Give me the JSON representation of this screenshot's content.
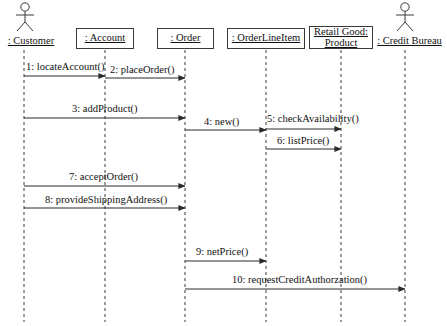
{
  "diagram": {
    "type": "uml-sequence-diagram",
    "width": 447,
    "height": 326,
    "background_color": "#ffffff",
    "line_color": "#3a3a3a",
    "text_color": "#111111",
    "lifeline_style": "dashed"
  },
  "participants": [
    {
      "id": "customer",
      "label": ": Customer",
      "kind": "actor",
      "x": 24,
      "box": {
        "left": 0,
        "top": 35,
        "width": 62,
        "height": 14
      },
      "figure": {
        "left": 14,
        "top": 2,
        "width": 22,
        "height": 30
      }
    },
    {
      "id": "account",
      "label": ": Account",
      "kind": "object",
      "x": 105,
      "box": {
        "left": 76,
        "top": 28,
        "width": 58,
        "height": 21
      }
    },
    {
      "id": "order",
      "label": ": Order",
      "kind": "object",
      "x": 185,
      "box": {
        "left": 157,
        "top": 28,
        "width": 57,
        "height": 21
      }
    },
    {
      "id": "orderlineitem",
      "label": ": OrderLineItem",
      "kind": "object",
      "x": 266,
      "box": {
        "left": 227,
        "top": 28,
        "width": 78,
        "height": 21
      }
    },
    {
      "id": "product",
      "label_line1": "Retail Good:",
      "label_line2": "Product",
      "kind": "object",
      "x": 341,
      "box": {
        "left": 309,
        "top": 26,
        "width": 64,
        "height": 23
      }
    },
    {
      "id": "creditbureau",
      "label": ": Credit Bureau",
      "kind": "actor",
      "x": 405,
      "box": {
        "left": 372,
        "top": 35,
        "width": 75,
        "height": 14
      },
      "figure": {
        "left": 394,
        "top": 2,
        "width": 22,
        "height": 30
      }
    }
  ],
  "lifelines": {
    "top": 50,
    "bottom": 322
  },
  "messages": [
    {
      "seq": 1,
      "label": "1: locateAccount()",
      "from": "customer",
      "to": "account",
      "from_x": 24,
      "to_x": 105,
      "y": 76,
      "label_x": 26,
      "label_y": 61,
      "direction": "right"
    },
    {
      "seq": 2,
      "label": "2: placeOrder()",
      "from": "account",
      "to": "order",
      "from_x": 105,
      "to_x": 185,
      "y": 78,
      "label_x": 110,
      "label_y": 64,
      "direction": "right"
    },
    {
      "seq": 3,
      "label": "3: addProduct()",
      "from": "customer",
      "to": "order",
      "from_x": 24,
      "to_x": 185,
      "y": 118,
      "label_x": 72,
      "label_y": 103,
      "direction": "right"
    },
    {
      "seq": 4,
      "label": "4: new()",
      "from": "order",
      "to": "orderlineitem",
      "from_x": 185,
      "to_x": 266,
      "y": 130,
      "label_x": 204,
      "label_y": 116,
      "direction": "right"
    },
    {
      "seq": 5,
      "label": "5: checkAvailability()",
      "from": "orderlineitem",
      "to": "product",
      "from_x": 266,
      "to_x": 341,
      "y": 129,
      "label_x": 267,
      "label_y": 113,
      "direction": "right"
    },
    {
      "seq": 6,
      "label": "6: listPrice()",
      "from": "orderlineitem",
      "to": "product",
      "from_x": 266,
      "to_x": 341,
      "y": 149,
      "label_x": 277,
      "label_y": 135,
      "direction": "right"
    },
    {
      "seq": 7,
      "label": "7: acceptOrder()",
      "from": "customer",
      "to": "order",
      "from_x": 24,
      "to_x": 185,
      "y": 186,
      "label_x": 69,
      "label_y": 171,
      "direction": "right"
    },
    {
      "seq": 8,
      "label": "8: provideShippingAddress()",
      "from": "customer",
      "to": "order",
      "from_x": 24,
      "to_x": 185,
      "y": 208,
      "label_x": 45,
      "label_y": 194,
      "direction": "right"
    },
    {
      "seq": 9,
      "label": "9: netPrice()",
      "from": "order",
      "to": "orderlineitem",
      "from_x": 185,
      "to_x": 266,
      "y": 261,
      "label_x": 196,
      "label_y": 246,
      "direction": "right"
    },
    {
      "seq": 10,
      "label": "10: requestCreditAuthorzation()",
      "from": "order",
      "to": "creditbureau",
      "from_x": 185,
      "to_x": 405,
      "y": 289,
      "label_x": 232,
      "label_y": 274,
      "direction": "right"
    }
  ]
}
